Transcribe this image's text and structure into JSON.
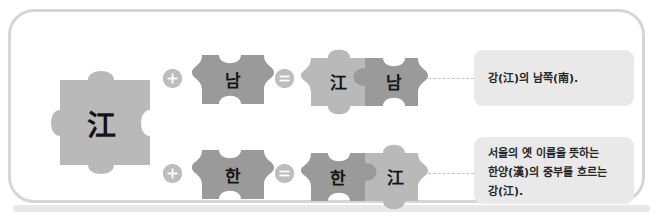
{
  "diagram": {
    "type": "word-formation-puzzle",
    "title_text": "",
    "frame": {
      "border_color": "#d6d6d6",
      "background": "#ffffff"
    },
    "colors": {
      "piece_light": "#b9b9b9",
      "piece_dark": "#9a9a9a",
      "badge": "#bdbdbd",
      "badge_glyph": "#ffffff",
      "desc_background": "#e9e9e9",
      "desc_text": "#262626",
      "connector": "#c5c5c5"
    },
    "source_piece": {
      "label": "江",
      "shade": "light"
    },
    "operators": {
      "plus_label": "+",
      "equals_label": "=",
      "plus_icon": "plus-circle-icon",
      "equals_icon": "equals-circle-icon"
    },
    "rows": [
      {
        "operand": {
          "label": "남",
          "shade": "dark"
        },
        "result": {
          "left": {
            "label": "江",
            "shade": "light"
          },
          "right": {
            "label": "남",
            "shade": "dark"
          }
        },
        "description_lines": [
          "강(江)의 남쪽(南)."
        ]
      },
      {
        "operand": {
          "label": "한",
          "shade": "dark"
        },
        "result": {
          "left": {
            "label": "한",
            "shade": "dark"
          },
          "right": {
            "label": "江",
            "shade": "light"
          }
        },
        "description_lines": [
          "서울의 옛 이름을 뜻하는",
          "한양(漢)의 중부를 흐르는",
          "강(江)."
        ]
      }
    ]
  }
}
